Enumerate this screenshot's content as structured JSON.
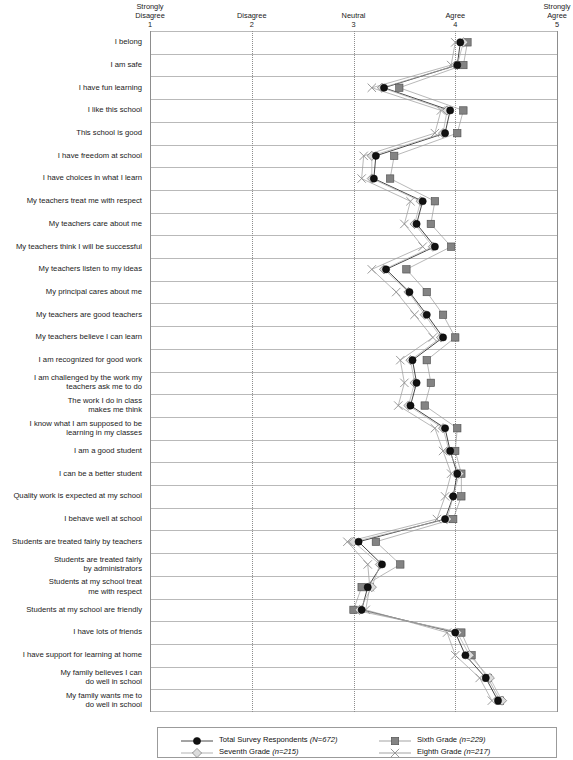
{
  "chart_data": {
    "type": "line",
    "title": "",
    "xlabel": "",
    "ylabel": "",
    "xlim": [
      1,
      5
    ],
    "grid": true,
    "orientation": "horizontal-categories",
    "legend_position": "bottom",
    "axis_ticks": [
      {
        "value": 1,
        "label": "Strongly\nDisagree",
        "number": "1"
      },
      {
        "value": 2,
        "label": "Disagree",
        "number": "2"
      },
      {
        "value": 3,
        "label": "Neutral",
        "number": "3"
      },
      {
        "value": 4,
        "label": "Agree",
        "number": "4"
      },
      {
        "value": 5,
        "label": "Strongly\nAgree",
        "number": "5"
      }
    ],
    "categories": [
      "I belong",
      "I am safe",
      "I have fun learning",
      "I like this school",
      "This school is good",
      "I have freedom at school",
      "I have choices in what I learn",
      "My teachers treat me with respect",
      "My teachers care about me",
      "My teachers think I will be successful",
      "My teachers listen to my ideas",
      "My principal cares about me",
      "My teachers are good teachers",
      "My teachers believe I can learn",
      "I am recognized for good work",
      "I am challenged by the work my\nteachers ask me to do",
      "The work I do in class\nmakes me think",
      "I know what I am supposed to be\nlearning in my classes",
      "I am a good student",
      "I can be a better student",
      "Quality work is expected at my school",
      "I behave well at school",
      "Students are treated fairly by teachers",
      "Students are treated fairly\nby administrators",
      "Students at my school treat\nme with respect",
      "Students at my school are friendly",
      "I have lots of friends",
      "I have support for learning at home",
      "My family believes I can\ndo well in school",
      "My family wants me to\ndo well in school"
    ],
    "series": [
      {
        "name": "Total Survey Respondents (N=672)",
        "legend_label": "Total Survey Respondents",
        "legend_n": "(N=672)",
        "marker": "filled-circle",
        "color": "#111111",
        "values": [
          4.05,
          4.02,
          3.3,
          3.95,
          3.9,
          3.22,
          3.2,
          3.68,
          3.62,
          3.8,
          3.32,
          3.55,
          3.72,
          3.88,
          3.58,
          3.62,
          3.56,
          3.9,
          3.95,
          4.02,
          3.98,
          3.9,
          3.05,
          3.28,
          3.14,
          3.08,
          4.0,
          4.1,
          4.3,
          4.42
        ]
      },
      {
        "name": "Sixth Grade (n=229)",
        "legend_label": "Sixth Grade",
        "legend_n": "(n=229)",
        "marker": "filled-square",
        "color": "#808080",
        "values": [
          4.12,
          4.08,
          3.45,
          4.08,
          4.02,
          3.4,
          3.36,
          3.8,
          3.76,
          3.96,
          3.52,
          3.72,
          3.88,
          4.0,
          3.72,
          3.76,
          3.7,
          4.02,
          4.0,
          4.06,
          4.06,
          3.98,
          3.22,
          3.46,
          3.08,
          3.0,
          4.06,
          4.16,
          4.32,
          4.44
        ]
      },
      {
        "name": "Seventh Grade (n=215)",
        "legend_label": "Seventh Grade",
        "legend_n": "(n=215)",
        "marker": "open-diamond",
        "color": "#d8d8d8",
        "values": [
          4.08,
          4.02,
          3.28,
          3.92,
          3.88,
          3.18,
          3.18,
          3.66,
          3.6,
          3.78,
          3.3,
          3.54,
          3.7,
          3.86,
          3.56,
          3.6,
          3.54,
          3.88,
          3.94,
          4.04,
          3.98,
          3.92,
          3.0,
          3.26,
          3.18,
          3.06,
          4.02,
          4.14,
          4.34,
          4.46
        ]
      },
      {
        "name": "Eighth Grade (n=217)",
        "legend_label": "Eighth Grade",
        "legend_n": "(n=217)",
        "marker": "x-cross",
        "color": "#9a9a9a",
        "values": [
          4.0,
          3.96,
          3.18,
          3.86,
          3.8,
          3.1,
          3.08,
          3.56,
          3.5,
          3.68,
          3.18,
          3.42,
          3.6,
          3.78,
          3.46,
          3.5,
          3.44,
          3.8,
          3.88,
          3.96,
          3.9,
          3.82,
          2.94,
          3.14,
          3.16,
          3.12,
          3.92,
          4.0,
          4.24,
          4.36
        ]
      }
    ]
  },
  "colors": {
    "grid": "#b9b9b9",
    "vgrid": "#8d8d8d",
    "text": "#1a1a1a",
    "total": "#111111",
    "sixth": "#808080",
    "seventh": "#d8d8d8",
    "eighth": "#9a9a9a"
  }
}
